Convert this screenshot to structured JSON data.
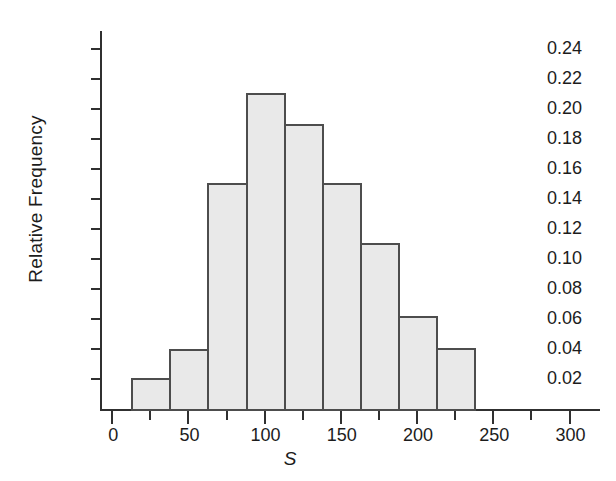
{
  "chart_data": {
    "type": "bar",
    "title": "",
    "subtitle": "",
    "xlabel": "S",
    "ylabel": "Relative Frequency",
    "xlim": [
      -8,
      320
    ],
    "ylim": [
      0,
      0.252
    ],
    "grid": false,
    "legend": null,
    "bin_width": 25,
    "bin_edges": [
      12.5,
      37.5,
      62.5,
      87.5,
      112.5,
      137.5,
      162.5,
      187.5,
      212.5,
      237.5
    ],
    "categories": [
      "12.5-37.5",
      "37.5-62.5",
      "62.5-87.5",
      "87.5-112.5",
      "112.5-137.5",
      "137.5-162.5",
      "162.5-187.5",
      "187.5-212.5",
      "212.5-237.5"
    ],
    "values": [
      0.021,
      0.04,
      0.151,
      0.211,
      0.19,
      0.151,
      0.111,
      0.062,
      0.041
    ],
    "x_tick_values": [
      0,
      25,
      50,
      75,
      100,
      125,
      150,
      175,
      200,
      225,
      250,
      275,
      300
    ],
    "x_major_ticks": [
      0,
      50,
      100,
      150,
      200,
      250,
      300
    ],
    "x_tick_labels": [
      "0",
      "50",
      "100",
      "150",
      "200",
      "250",
      "300"
    ],
    "y_tick_values": [
      0.02,
      0.04,
      0.06,
      0.08,
      0.1,
      0.12,
      0.14,
      0.16,
      0.18,
      0.2,
      0.22,
      0.24
    ],
    "y_tick_labels": [
      "0.02",
      "0.04",
      "0.06",
      "0.08",
      "0.10",
      "0.12",
      "0.14",
      "0.16",
      "0.18",
      "0.20",
      "0.22",
      "0.24"
    ],
    "bar_fill_color": "#e9e9e9",
    "bar_edge_color": "#4d4d4d",
    "axis_color": "#303030",
    "text_color": "#1c1c1c",
    "background_color": "#ffffff"
  },
  "axes": {
    "y_label": "Relative Frequency",
    "x_label": "S"
  }
}
